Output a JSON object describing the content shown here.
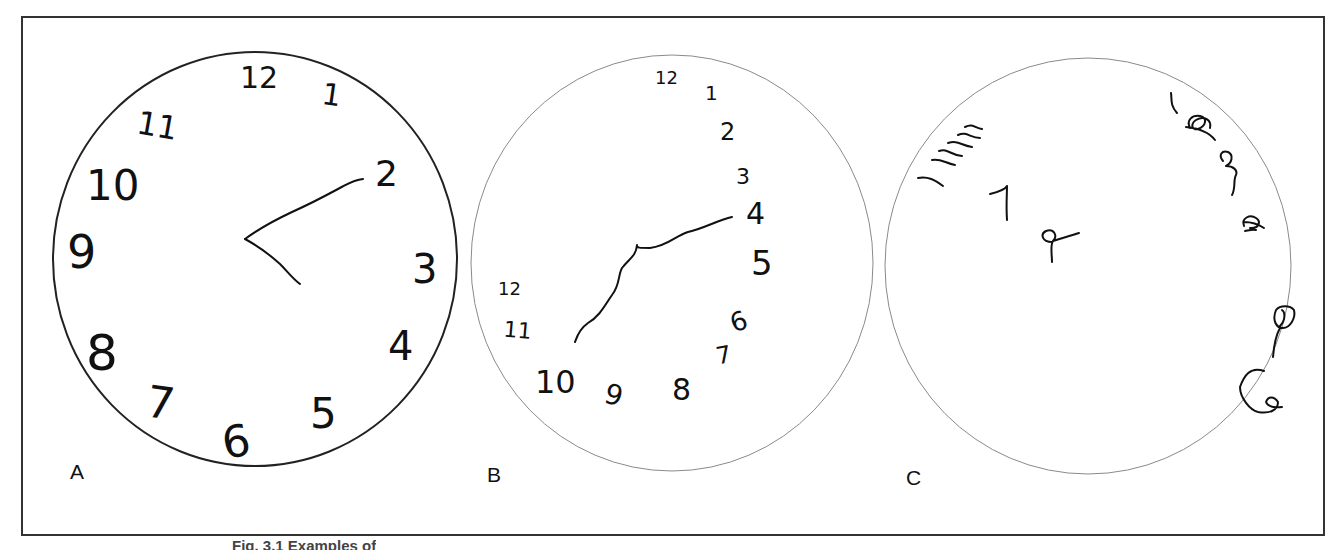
{
  "figure": {
    "caption": "Fig. 3.1 Examples of",
    "panels": [
      {
        "label": "A",
        "description": "Normal clock drawing: all numbers 1-12 placed correctly, two hands pointing to 11 and 2 area",
        "numerals": [
          "12",
          "1",
          "2",
          "3",
          "4",
          "5",
          "6",
          "7",
          "8",
          "9",
          "10",
          "11"
        ]
      },
      {
        "label": "B",
        "description": "Clock with numbers crowded onto right side; numbers continue around to 12 at left",
        "numerals": [
          "12",
          "1",
          "2",
          "3",
          "4",
          "5",
          "6",
          "7",
          "8",
          "9",
          "10",
          "11",
          "12"
        ]
      },
      {
        "label": "C",
        "description": "Severely disorganised clock with scribbled, unrecognisable numerals",
        "numerals": [
          "1",
          "7",
          "9"
        ]
      }
    ]
  },
  "colors": {
    "ink": "#111111",
    "frame": "#333333",
    "circle_a": "#222222",
    "circle_bc": "#8a8a8a",
    "background": "#ffffff"
  }
}
